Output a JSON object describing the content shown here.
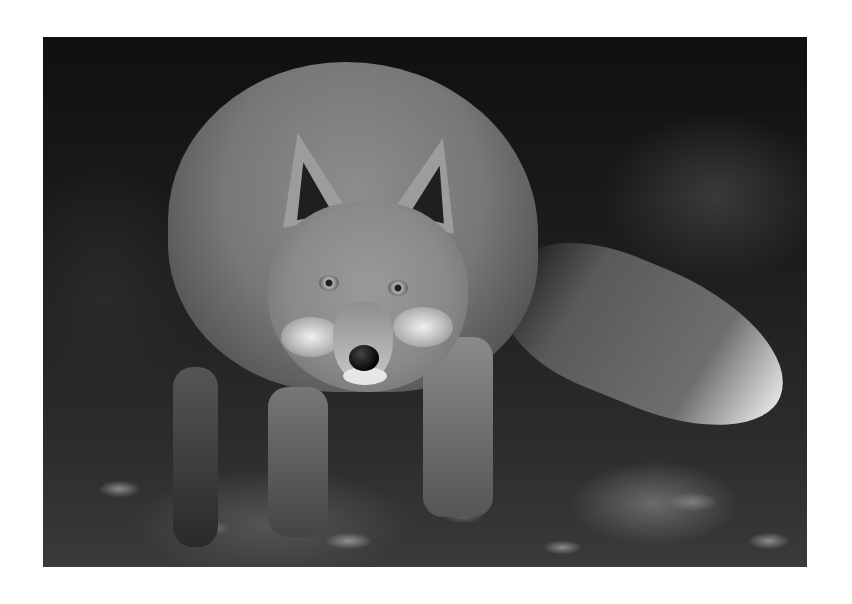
{
  "image": {
    "subject": "red fox in black and white, looking at camera",
    "style": "grayscale photograph",
    "background": "#ffffff",
    "photo_frame": {
      "x": 43,
      "y": 37,
      "width": 764,
      "height": 530
    },
    "elements": [
      "fox-head",
      "fox-ears",
      "fox-eyes",
      "fox-nose",
      "fox-body",
      "fox-tail",
      "fox-legs",
      "leaf-litter-ground",
      "dark-foliage-background"
    ]
  }
}
